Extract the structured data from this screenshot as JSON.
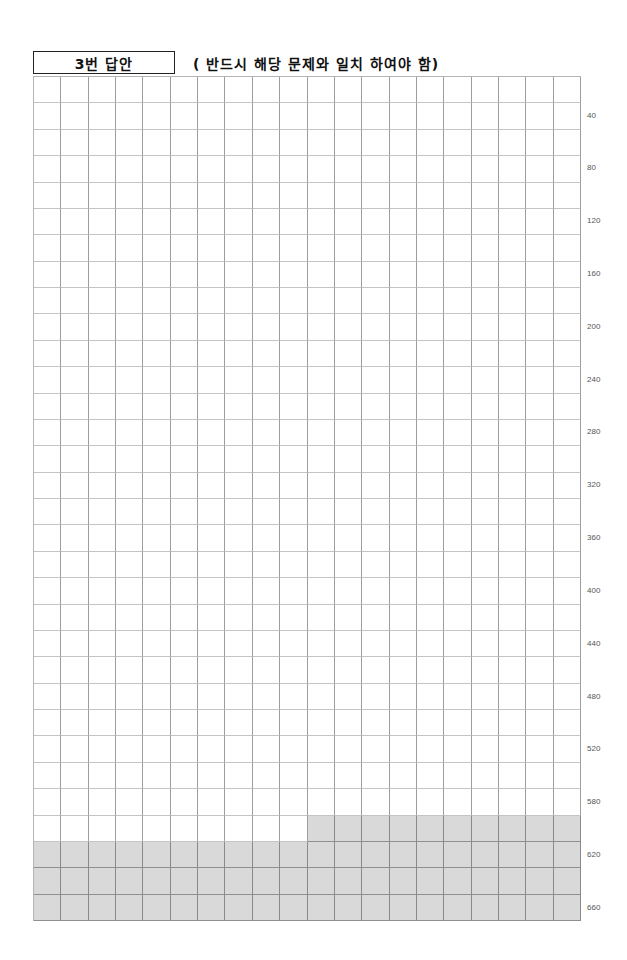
{
  "header": {
    "title": "3번 답안",
    "notice": "( 반드시 해당 문제와 일치 하여야 함)"
  },
  "answer_grid": {
    "columns": 20,
    "rows": 32,
    "shading": {
      "color": "#d9d9d9",
      "partial_row": 29,
      "partial_row_start_column": 11,
      "full_rows": [
        30,
        31,
        32
      ]
    },
    "row_labels": [
      {
        "row": 2,
        "text": "40"
      },
      {
        "row": 4,
        "text": "80"
      },
      {
        "row": 6,
        "text": "120"
      },
      {
        "row": 8,
        "text": "160"
      },
      {
        "row": 10,
        "text": "200"
      },
      {
        "row": 12,
        "text": "240"
      },
      {
        "row": 14,
        "text": "280"
      },
      {
        "row": 16,
        "text": "320"
      },
      {
        "row": 18,
        "text": "360"
      },
      {
        "row": 20,
        "text": "400"
      },
      {
        "row": 22,
        "text": "440"
      },
      {
        "row": 24,
        "text": "480"
      },
      {
        "row": 26,
        "text": "520"
      },
      {
        "row": 28,
        "text": "580"
      },
      {
        "row": 30,
        "text": "620"
      },
      {
        "row": 32,
        "text": "660"
      }
    ]
  }
}
